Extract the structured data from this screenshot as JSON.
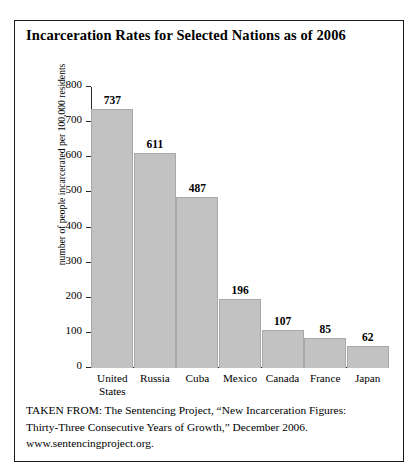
{
  "figure": {
    "title": "Incarceration Rates for Selected Nations as of 2006"
  },
  "chart_data": {
    "type": "bar",
    "title": "Incarceration Rates for Selected Nations as of 2006",
    "xlabel": "",
    "ylabel": "number of people incarcerated per 100,000 residents",
    "categories": [
      "United States",
      "Russia",
      "Cuba",
      "Mexico",
      "Canada",
      "France",
      "Japan"
    ],
    "category_lines": [
      [
        "United",
        "States"
      ],
      [
        "Russia"
      ],
      [
        "Cuba"
      ],
      [
        "Mexico"
      ],
      [
        "Canada"
      ],
      [
        "France"
      ],
      [
        "Japan"
      ]
    ],
    "values": [
      737,
      611,
      487,
      196,
      107,
      85,
      62
    ],
    "value_labels": [
      "737",
      "611",
      "487",
      "196",
      "107",
      "85",
      "62"
    ],
    "ylim": [
      0,
      800
    ],
    "ytick_values": [
      0,
      100,
      200,
      300,
      400,
      500,
      600,
      700,
      800
    ],
    "ytick_labels": [
      "0",
      "100",
      "200",
      "300",
      "400",
      "500",
      "600",
      "700",
      "800"
    ],
    "grid": false,
    "legend": false,
    "bar_color": "#c2c2c2",
    "bar_edge_color": "#a8a8a8",
    "axis_color": "#2b2b2b",
    "background": "#ffffff"
  },
  "citation": {
    "line1": "TAKEN FROM: The Sentencing Project, “New Incarceration Figures:",
    "line2": "Thirty-Three Consecutive Years of Growth,” December 2006.",
    "line3": "www.sentencingproject.org."
  }
}
